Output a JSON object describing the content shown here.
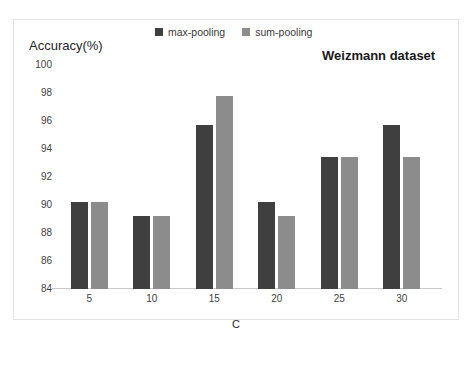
{
  "chart_data": {
    "type": "bar",
    "title": "Weizmann dataset",
    "xlabel": "C",
    "ylabel": "Accuracy(%)",
    "categories": [
      "5",
      "10",
      "15",
      "20",
      "25",
      "30"
    ],
    "series": [
      {
        "name": "max-pooling",
        "color": "#3f3f3f",
        "values": [
          90.2,
          89.2,
          95.7,
          90.2,
          93.4,
          95.7
        ]
      },
      {
        "name": "sum-pooling",
        "color": "#8c8c8c",
        "values": [
          90.2,
          89.2,
          97.8,
          89.2,
          93.4,
          93.4
        ]
      }
    ],
    "ylim": [
      84,
      100
    ],
    "yticks": [
      100,
      98,
      96,
      94,
      92,
      90,
      88,
      86,
      84
    ],
    "grid": false,
    "legend_position": "top-center"
  }
}
